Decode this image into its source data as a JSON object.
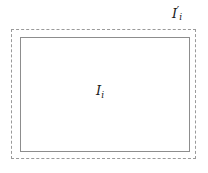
{
  "figure": {
    "background_color": "#ffffff",
    "width": 208,
    "height": 173
  },
  "outer_region": {
    "name": "outer-dashed-rectangle",
    "label_base": "I",
    "label_prime": "′",
    "label_subscript": "i",
    "label_full": "I′ᵢ",
    "stroke_style": "dashed",
    "stroke_color": "#9a9a9a",
    "fill": "none",
    "x": 11,
    "y": 29,
    "width": 185,
    "height": 130
  },
  "inner_region": {
    "name": "inner-solid-rectangle",
    "label_base": "I",
    "label_subscript": "i",
    "label_full": "Iᵢ",
    "stroke_style": "solid",
    "stroke_color": "#8d8d8d",
    "fill": "none",
    "x": 20,
    "y": 37,
    "width": 170,
    "height": 115
  }
}
